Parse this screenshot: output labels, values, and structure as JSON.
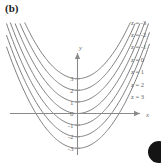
{
  "figure": {
    "panel_label": "(b)",
    "axis_labels": {
      "x": "x",
      "y": "y"
    },
    "y_ticks": [
      "3",
      "2",
      "1",
      "0",
      "-1",
      "-2",
      "-3"
    ],
    "y_tick_values": [
      3,
      2,
      1,
      0,
      -1,
      -2,
      -3
    ],
    "level_labels": [
      "z = -3",
      "z = -2",
      "z = -1",
      "z = 0",
      "z = 1",
      "z = 2",
      "z = 3"
    ],
    "colors": {
      "curve": "#7e7e7e",
      "axis": "#8a8a8a",
      "text": "#6b6b6b",
      "panel_label": "#1b1b1b",
      "background": "#ffffff",
      "corner_mark": "#141414"
    }
  },
  "chart_data": {
    "type": "line",
    "title": "",
    "subtitle": "",
    "xlabel": "x",
    "ylabel": "y",
    "xlim": [
      -2.6,
      2.6
    ],
    "ylim": [
      -3.6,
      4.2
    ],
    "grid": false,
    "legend": "right-inline-labels",
    "annotations": [
      "(b)"
    ],
    "x": [
      -2.5,
      -2.0,
      -1.5,
      -1.0,
      -0.5,
      0.0,
      0.5,
      1.0,
      1.5,
      2.0,
      2.5
    ],
    "series": [
      {
        "name": "z = -3",
        "vertex": [
          0,
          3
        ],
        "values": [
          9.25,
          7.0,
          5.25,
          4.0,
          3.25,
          3.0,
          3.25,
          4.0,
          5.25,
          7.0,
          9.25
        ]
      },
      {
        "name": "z = -2",
        "vertex": [
          0,
          2
        ],
        "values": [
          8.25,
          6.0,
          4.25,
          3.0,
          2.25,
          2.0,
          2.25,
          3.0,
          4.25,
          6.0,
          8.25
        ]
      },
      {
        "name": "z = -1",
        "vertex": [
          0,
          1
        ],
        "values": [
          7.25,
          5.0,
          3.25,
          2.0,
          1.25,
          1.0,
          1.25,
          2.0,
          3.25,
          5.0,
          7.25
        ]
      },
      {
        "name": "z = 0",
        "vertex": [
          0,
          0
        ],
        "values": [
          6.25,
          4.0,
          2.25,
          1.0,
          0.25,
          0.0,
          0.25,
          1.0,
          2.25,
          4.0,
          6.25
        ]
      },
      {
        "name": "z = 1",
        "vertex": [
          0,
          -1
        ],
        "values": [
          5.25,
          3.0,
          1.25,
          0.0,
          -0.75,
          -1.0,
          -0.75,
          0.0,
          1.25,
          3.0,
          5.25
        ]
      },
      {
        "name": "z = 2",
        "vertex": [
          0,
          -2
        ],
        "values": [
          4.25,
          2.0,
          0.25,
          -1.0,
          -1.75,
          -2.0,
          -1.75,
          -1.0,
          0.25,
          2.0,
          4.25
        ]
      },
      {
        "name": "z = 3",
        "vertex": [
          0,
          -3
        ],
        "values": [
          3.25,
          1.0,
          -0.75,
          -2.0,
          -2.75,
          -3.0,
          -2.75,
          -2.0,
          -0.75,
          1.0,
          3.25
        ]
      }
    ],
    "xticks": [],
    "xticklabels": [],
    "yticks": [
      3,
      2,
      1,
      0,
      -1,
      -2,
      -3
    ],
    "yticklabels": [
      "3",
      "2",
      "1",
      "0",
      "-1",
      "-2",
      "-3"
    ]
  }
}
